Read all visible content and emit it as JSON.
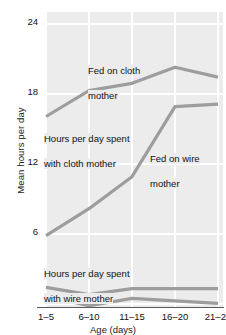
{
  "chart_data": {
    "type": "line",
    "title": "",
    "xlabel": "Age (days)",
    "ylabel": "Mean hours per day",
    "categories": [
      "1–5",
      "6–10",
      "11–15",
      "16–20",
      "21–25"
    ],
    "yticks": [
      6,
      12,
      18,
      24
    ],
    "ylim": [
      0,
      24
    ],
    "grid": true,
    "legend": "annotations-inline",
    "series": [
      {
        "name": "Hours per day spent with cloth mother (fed on cloth mother)",
        "values": [
          15.5,
          17.6,
          18.2,
          19.5,
          18.7
        ]
      },
      {
        "name": "Hours per day spent with cloth mother (fed on wire mother)",
        "values": [
          5.8,
          8.0,
          10.6,
          16.3,
          16.5
        ]
      },
      {
        "name": "Hours per day spent with wire mother (fed on wire mother)",
        "values": [
          1.6,
          1.0,
          1.5,
          1.5,
          1.5
        ]
      },
      {
        "name": "Hours per day spent with wire mother (fed on cloth mother)",
        "values": [
          0.9,
          0.1,
          0.7,
          0.5,
          0.3
        ]
      }
    ],
    "annotations": [
      {
        "id": "fed-on-cloth-mother",
        "text": "Fed on cloth\nmother"
      },
      {
        "id": "hours-with-cloth-mother",
        "text": "Hours per day spent\nwith cloth mother"
      },
      {
        "id": "fed-on-wire-mother",
        "text": "Fed on wire\nmother"
      },
      {
        "id": "hours-with-wire-mother",
        "text": "Hours per day spent\nwith wire mother"
      }
    ],
    "colors": {
      "line": "#9d9d9d",
      "plot_background": "#ececec",
      "gridline": "#ffffff",
      "text": "#111111"
    }
  },
  "axis": {
    "y": {
      "title": "Mean hours per day",
      "ticks": [
        "24",
        "18",
        "12",
        "6"
      ]
    },
    "x": {
      "title": "Age (days)",
      "ticks": [
        "1–5",
        "6–10",
        "11–15",
        "16–20",
        "21–25"
      ]
    }
  },
  "annotations": {
    "fed_cloth_l1": "Fed on cloth",
    "fed_cloth_l2": "mother",
    "hours_cloth_l1": "Hours per day spent",
    "hours_cloth_l2": "with cloth mother",
    "fed_wire_l1": "Fed on wire",
    "fed_wire_l2": "mother",
    "hours_wire_l1": "Hours per day spent",
    "hours_wire_l2": "with wire mother"
  }
}
